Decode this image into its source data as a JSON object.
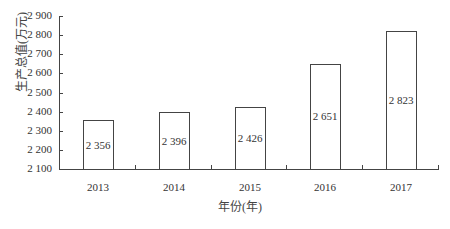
{
  "chart_data": {
    "type": "bar",
    "title": "",
    "xlabel": "年份(年)",
    "ylabel": "生产总值(万元)",
    "categories": [
      "2013",
      "2014",
      "2015",
      "2016",
      "2017"
    ],
    "values": [
      2356,
      2396,
      2426,
      2651,
      2823
    ],
    "value_labels": [
      "2 356",
      "2 396",
      "2 426",
      "2 651",
      "2 823"
    ],
    "ylim": [
      2100,
      2900
    ],
    "yticks": [
      2100,
      2200,
      2300,
      2400,
      2500,
      2600,
      2700,
      2800,
      2900
    ],
    "ytick_labels": [
      "2 100",
      "2 200",
      "2 300",
      "2 400",
      "2 500",
      "2 600",
      "2 700",
      "2 800",
      "2 900"
    ],
    "grid": false,
    "legend": null,
    "bar_fill": "#ffffff",
    "bar_stroke": "#444444"
  }
}
